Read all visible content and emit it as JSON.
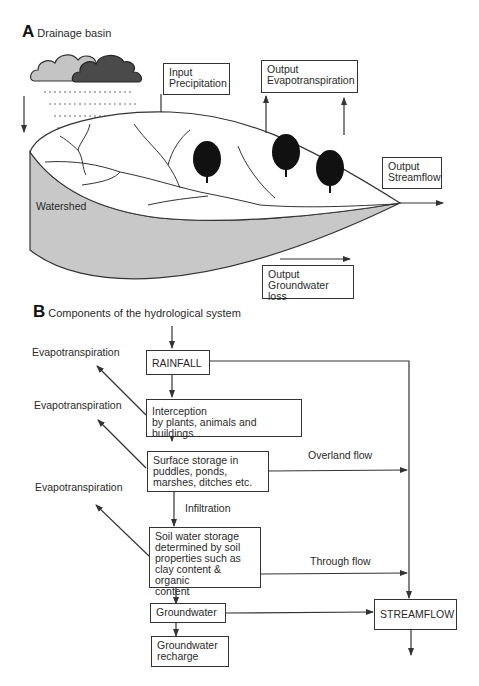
{
  "panel_a": {
    "letter": "A",
    "title": "Drainage basin",
    "input_precipitation": "Input\nPrecipitation",
    "output_evapotranspiration": "Output\nEvapotranspiration",
    "output_streamflow": "Output\nStreamflow",
    "output_groundwater_loss": "Output\nGroundwater loss",
    "watershed_label": "Watershed"
  },
  "panel_b": {
    "letter": "B",
    "title": "Components of the hydrological system",
    "boxes": {
      "rainfall": "RAINFALL",
      "interception": "Interception\nby plants, animals and buildings",
      "surface_storage": "Surface storage in\npuddles, ponds,\nmarshes,  ditches etc.",
      "soil_water": "Soil water storage\ndetermined by soil\nproperties such as\nclay content & organic\ncontent",
      "groundwater": "Groundwater",
      "groundwater_recharge": "Groundwater\nrecharge",
      "streamflow": "STREAMFLOW"
    },
    "labels": {
      "evapotranspiration_1": "Evapotranspiration",
      "evapotranspiration_2": "Evapotranspiration",
      "evapotranspiration_3": "Evapotranspiration",
      "overland_flow": "Overland flow",
      "infiltration": "Infiltration",
      "through_flow": "Through flow"
    }
  },
  "colors": {
    "line": "#333333",
    "watershed_fill": "#c8c8c8",
    "cloud_light": "#c4c4c4",
    "cloud_dark": "#4a4a4a",
    "tree": "#111111"
  }
}
